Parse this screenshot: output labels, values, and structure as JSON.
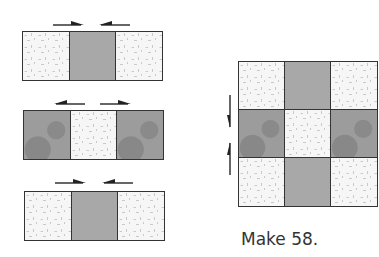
{
  "diagram": {
    "type": "quilt-block-assembly",
    "rows": [
      {
        "squares": [
          "light",
          "dark",
          "light"
        ],
        "press_arrows": [
          "right",
          "left"
        ]
      },
      {
        "squares": [
          "mottled",
          "light",
          "mottled"
        ],
        "press_arrows": [
          "left",
          "right"
        ]
      },
      {
        "squares": [
          "light",
          "dark",
          "light"
        ],
        "press_arrows": [
          "right",
          "left"
        ]
      }
    ],
    "block": {
      "squares": [
        [
          "light",
          "dark",
          "light"
        ],
        [
          "mottled",
          "light",
          "mottled"
        ],
        [
          "light",
          "dark",
          "light"
        ]
      ],
      "press_arrows": [
        "down",
        "up"
      ]
    },
    "caption": "Make 58."
  },
  "colors": {
    "outline": "#333333",
    "light": "#f6f6f6",
    "dark": "#a8a8a8",
    "mottled": "#9c9c9c"
  }
}
